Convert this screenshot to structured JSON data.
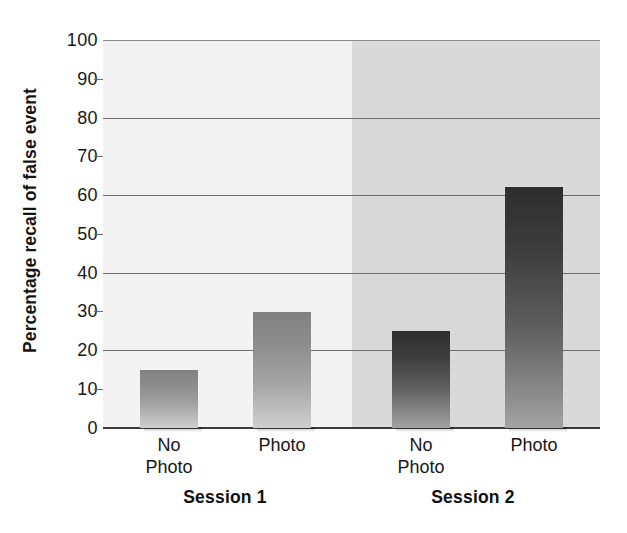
{
  "chart_data": {
    "type": "bar",
    "title": "",
    "xlabel": "",
    "ylabel": "Percentage recall of false event",
    "ylim": [
      0,
      100
    ],
    "grid": true,
    "legend_position": "none",
    "categories": [
      "No Photo",
      "Photo",
      "No Photo",
      "Photo"
    ],
    "values": [
      15,
      30,
      25,
      62
    ],
    "groups": [
      {
        "label": "Session 1",
        "categories": [
          "No Photo",
          "Photo"
        ],
        "values": [
          15,
          30
        ]
      },
      {
        "label": "Session 2",
        "categories": [
          "No Photo",
          "Photo"
        ],
        "values": [
          25,
          62
        ]
      }
    ],
    "y_major_ticks": [
      0,
      20,
      40,
      60,
      80,
      100
    ],
    "y_minor_ticks": [
      10,
      30,
      50,
      70,
      90
    ],
    "y_tick_labels": [
      "100",
      "90",
      "80",
      "70",
      "60",
      "50",
      "40",
      "30",
      "20",
      "10",
      "0"
    ]
  },
  "axis": {
    "y_title": "Percentage recall of false event",
    "labels": {
      "t100": "100",
      "t90": "90",
      "t80": "80",
      "t70": "70",
      "t60": "60",
      "t50": "50",
      "t40": "40",
      "t30": "30",
      "t20": "20",
      "t10": "10",
      "t0": "0"
    }
  },
  "x_axis": {
    "ticks": [
      {
        "line1": "No",
        "line2": "Photo"
      },
      {
        "line1": "Photo",
        "line2": ""
      },
      {
        "line1": "No",
        "line2": "Photo"
      },
      {
        "line1": "Photo",
        "line2": ""
      }
    ]
  },
  "groups": {
    "session1": "Session 1",
    "session2": "Session 2"
  },
  "colors": {
    "session1_background": "#f3f3f3",
    "session2_background": "#d9d9d9",
    "bar_light_top": "#818181",
    "bar_light_bottom": "#cfcfcf",
    "bar_dark_top": "#2e2e2e",
    "bar_dark_bottom": "#a3a3a3",
    "gridline": "#6e6e6e",
    "axis": "#3b3b3b",
    "text": "#171717"
  }
}
